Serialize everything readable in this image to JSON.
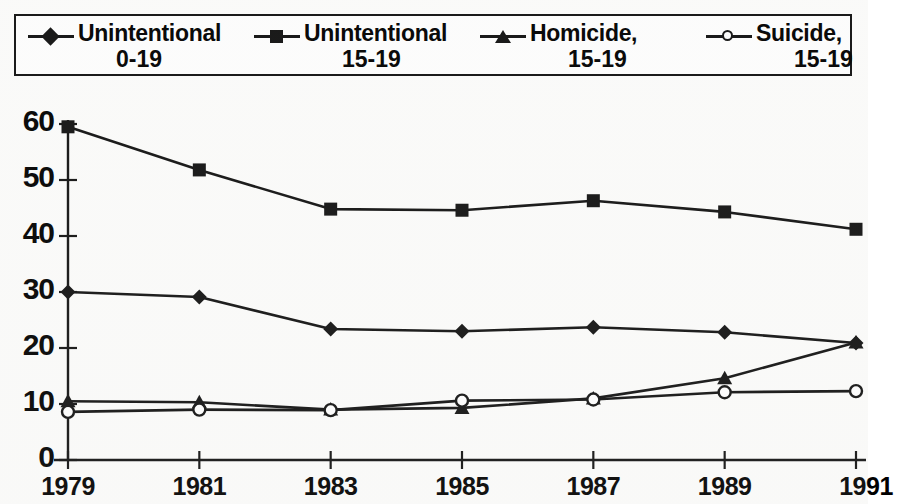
{
  "legend": {
    "entries": [
      {
        "name": "unintentional-0-19",
        "line1": "Unintentional",
        "line2": "0-19",
        "marker": "diamond"
      },
      {
        "name": "unintentional-15-19",
        "line1": "Unintentional",
        "line2": "15-19",
        "marker": "square"
      },
      {
        "name": "homicide-15-19",
        "line1": "Homicide,",
        "line2": "15-19",
        "marker": "triangle"
      },
      {
        "name": "suicide-15-19",
        "line1": "Suicide,",
        "line2": "15-19",
        "marker": "circle"
      }
    ]
  },
  "axes": {
    "y_ticks": [
      "0",
      "10",
      "20",
      "30",
      "40",
      "50",
      "60"
    ],
    "x_ticks": [
      "1979",
      "1981",
      "1983",
      "1985",
      "1987",
      "1989",
      "1991"
    ]
  },
  "colors": {
    "ink": "#111111",
    "paper": "#fdfdfc"
  },
  "chart_data": {
    "type": "line",
    "title": "",
    "xlabel": "",
    "ylabel": "",
    "x": [
      1979,
      1981,
      1983,
      1985,
      1987,
      1989,
      1991
    ],
    "categories": [
      "1979",
      "1981",
      "1983",
      "1985",
      "1987",
      "1989",
      "1991"
    ],
    "ylim": [
      0,
      60
    ],
    "xlim": [
      1979,
      1991
    ],
    "grid": false,
    "legend_position": "top",
    "series": [
      {
        "name": "Unintentional 0-19",
        "marker": "diamond",
        "values": [
          30.0,
          29.1,
          23.4,
          23.0,
          23.7,
          22.8,
          20.9
        ]
      },
      {
        "name": "Unintentional 15-19",
        "marker": "square",
        "values": [
          59.5,
          51.8,
          44.8,
          44.6,
          46.3,
          44.3,
          41.2
        ]
      },
      {
        "name": "Homicide, 15-19",
        "marker": "triangle",
        "values": [
          10.5,
          10.3,
          9.0,
          9.3,
          11.0,
          14.6,
          21.0
        ]
      },
      {
        "name": "Suicide, 15-19",
        "marker": "circle",
        "values": [
          8.6,
          9.0,
          8.9,
          10.6,
          10.8,
          12.1,
          12.3
        ]
      }
    ]
  }
}
